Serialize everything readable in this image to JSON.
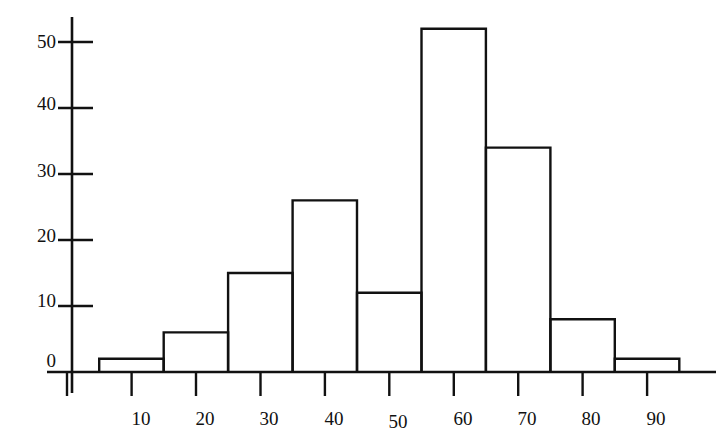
{
  "chart_data": {
    "type": "bar",
    "title": "",
    "subtitle": "",
    "xlabel": "",
    "ylabel": "",
    "grid": false,
    "legend": false,
    "legend_position": "none",
    "bin_width": 10,
    "bin_edges": [
      5,
      15,
      25,
      35,
      45,
      55,
      65,
      75,
      85,
      95
    ],
    "categories": [
      "5-15",
      "15-25",
      "25-35",
      "35-45",
      "45-55",
      "55-65",
      "65-75",
      "75-85",
      "85-95"
    ],
    "bin_centers": [
      10,
      20,
      30,
      40,
      50,
      60,
      70,
      80,
      90
    ],
    "values": [
      2,
      6,
      15,
      26,
      12,
      52,
      34,
      8,
      2
    ],
    "xlim": [
      0,
      99
    ],
    "ylim": [
      0,
      54
    ],
    "xticks": [
      10,
      20,
      30,
      40,
      50,
      60,
      70,
      80,
      90
    ],
    "xtick_labels": [
      "10",
      "20",
      "30",
      "40",
      "50",
      "60",
      "70",
      "80",
      "90"
    ],
    "yticks": [
      0,
      10,
      20,
      30,
      40,
      50
    ],
    "ytick_labels": [
      "0",
      "10",
      "20",
      "30",
      "40",
      "50"
    ],
    "annotations": [],
    "bar_style": {
      "fill": "none",
      "stroke": "#111111"
    }
  },
  "axes": {
    "y_labels": [
      {
        "text": "50",
        "value": 50
      },
      {
        "text": "40",
        "value": 40
      },
      {
        "text": "30",
        "value": 30
      },
      {
        "text": "20",
        "value": 20
      },
      {
        "text": "10",
        "value": 10
      },
      {
        "text": "0",
        "value": 0
      }
    ],
    "x_labels": [
      {
        "text": "10",
        "value": 10
      },
      {
        "text": "20",
        "value": 20
      },
      {
        "text": "30",
        "value": 30
      },
      {
        "text": "40",
        "value": 40
      },
      {
        "text": "50",
        "value": 50
      },
      {
        "text": "60",
        "value": 60
      },
      {
        "text": "70",
        "value": 70
      },
      {
        "text": "80",
        "value": 80
      },
      {
        "text": "90",
        "value": 90
      }
    ]
  },
  "colors": {
    "ink": "#111111",
    "background": "#ffffff"
  }
}
